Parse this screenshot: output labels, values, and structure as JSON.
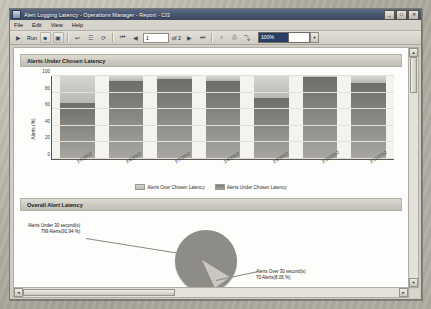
{
  "window": {
    "title": "Alert Logging Latency - Operations Manager - Report - CI3",
    "icon": "report-window-icon",
    "buttons": [
      {
        "name": "minimize-button",
        "glyph": "_"
      },
      {
        "name": "maximize-button",
        "glyph": "□"
      },
      {
        "name": "close-button",
        "glyph": "✕"
      }
    ]
  },
  "menubar": {
    "items": [
      {
        "name": "menu-file",
        "label": "File"
      },
      {
        "name": "menu-edit",
        "label": "Edit"
      },
      {
        "name": "menu-view",
        "label": "View"
      },
      {
        "name": "menu-help",
        "label": "Help"
      }
    ]
  },
  "toolbar": {
    "run_label": "Run",
    "page_current": "1",
    "page_of": "of 2",
    "zoom_value": "100%",
    "icons": [
      {
        "name": "run-report-icon",
        "glyph": "▶"
      },
      {
        "name": "stop-icon",
        "glyph": "■"
      },
      {
        "name": "new-window-icon",
        "glyph": "▣"
      },
      {
        "name": "back-icon",
        "glyph": "↩"
      },
      {
        "name": "parameters-icon",
        "glyph": "☲"
      },
      {
        "name": "refresh-icon",
        "glyph": "⟳"
      },
      {
        "name": "first-page-icon",
        "glyph": "⏮"
      },
      {
        "name": "prev-page-icon",
        "glyph": "◀"
      },
      {
        "name": "next-page-icon",
        "glyph": "▶"
      },
      {
        "name": "last-page-icon",
        "glyph": "⏭"
      },
      {
        "name": "search-icon",
        "glyph": "⌕"
      },
      {
        "name": "print-icon",
        "glyph": "⎙"
      },
      {
        "name": "export-icon",
        "glyph": "⤵"
      }
    ]
  },
  "report": {
    "sections": [
      {
        "name": "section-alerts-under-chosen-latency",
        "title": "Alerts Under Chosen Latency"
      },
      {
        "name": "section-overall-alert-latency",
        "title": "Overall Alert Latency"
      }
    ]
  },
  "chart_data": [
    {
      "type": "bar",
      "title": "Alerts Under Chosen Latency",
      "xlabel": "",
      "ylabel": "Alerts (%)",
      "ylim": [
        0,
        100
      ],
      "yticks": [
        0,
        20,
        40,
        60,
        80,
        100
      ],
      "grid": true,
      "stacked": true,
      "legend_position": "bottom",
      "categories": [
        "2/5/2012",
        "2/6/2012",
        "2/7/2012",
        "2/8/2012",
        "2/9/2012",
        "2/10/2012",
        "2/11/2012"
      ],
      "series": [
        {
          "name": "Alerts Under Chosen Latency",
          "values": [
            68,
            94,
            96,
            94,
            74,
            99,
            91
          ]
        },
        {
          "name": "Alerts Over Chosen Latency",
          "values": [
            32,
            6,
            4,
            6,
            26,
            1,
            9
          ]
        }
      ]
    },
    {
      "type": "pie",
      "title": "Overall Alert Latency",
      "labels": [
        "Alerts Under 30 second(s)",
        "Alerts Over 30 second(s)"
      ],
      "values": [
        799,
        70
      ],
      "percents": [
        91.94,
        8.06
      ],
      "annotations": [
        {
          "name": "pie-label-under",
          "line1": "Alerts Under 30 second(s)",
          "line2": "799 Alerts(91.94 %)"
        },
        {
          "name": "pie-label-over",
          "line1": "Alerts Over 30 second(s)",
          "line2": "70 Alerts(8.06 %)"
        }
      ]
    }
  ],
  "scrollbars": {
    "up_glyph": "▲",
    "down_glyph": "▼",
    "left_glyph": "◄",
    "right_glyph": "►"
  }
}
